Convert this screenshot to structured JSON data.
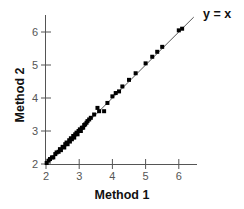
{
  "chart_data": {
    "type": "scatter",
    "title": "",
    "xlabel": "Method 1",
    "ylabel": "Method 2",
    "xlim": [
      2,
      6.5
    ],
    "ylim": [
      2,
      6.5
    ],
    "xticks": [
      "2",
      "3",
      "4",
      "5",
      "6"
    ],
    "yticks": [
      "2",
      "3",
      "4",
      "5",
      "6"
    ],
    "grid": false,
    "legend": null,
    "annotations": [
      {
        "text": "y = x",
        "position": "top-right, at end of identity line"
      }
    ],
    "reference_line": {
      "label": "y = x",
      "from": [
        2,
        2
      ],
      "to": [
        6.3,
        6.3
      ]
    },
    "series": [
      {
        "name": "Measurements",
        "marker": "square",
        "color": "#000000",
        "points": [
          [
            2.02,
            2.03
          ],
          [
            2.08,
            2.1
          ],
          [
            2.12,
            2.15
          ],
          [
            2.18,
            2.2
          ],
          [
            2.22,
            2.2
          ],
          [
            2.28,
            2.3
          ],
          [
            2.32,
            2.35
          ],
          [
            2.38,
            2.37
          ],
          [
            2.42,
            2.45
          ],
          [
            2.45,
            2.42
          ],
          [
            2.5,
            2.52
          ],
          [
            2.55,
            2.5
          ],
          [
            2.58,
            2.6
          ],
          [
            2.62,
            2.65
          ],
          [
            2.65,
            2.6
          ],
          [
            2.7,
            2.72
          ],
          [
            2.72,
            2.68
          ],
          [
            2.75,
            2.78
          ],
          [
            2.78,
            2.75
          ],
          [
            2.82,
            2.85
          ],
          [
            2.85,
            2.8
          ],
          [
            2.88,
            2.9
          ],
          [
            2.92,
            2.95
          ],
          [
            2.95,
            2.9
          ],
          [
            2.98,
            3.0
          ],
          [
            3.02,
            3.05
          ],
          [
            3.05,
            3.0
          ],
          [
            3.08,
            3.1
          ],
          [
            3.12,
            3.1
          ],
          [
            3.15,
            3.18
          ],
          [
            3.18,
            3.2
          ],
          [
            3.22,
            3.25
          ],
          [
            3.25,
            3.3
          ],
          [
            3.3,
            3.35
          ],
          [
            3.35,
            3.4
          ],
          [
            3.45,
            3.5
          ],
          [
            3.55,
            3.7
          ],
          [
            3.6,
            3.6
          ],
          [
            3.75,
            3.6
          ],
          [
            3.85,
            3.85
          ],
          [
            4.0,
            4.05
          ],
          [
            4.1,
            4.15
          ],
          [
            4.2,
            4.2
          ],
          [
            4.3,
            4.35
          ],
          [
            4.5,
            4.55
          ],
          [
            4.7,
            4.75
          ],
          [
            5.0,
            5.05
          ],
          [
            5.2,
            5.25
          ],
          [
            5.35,
            5.4
          ],
          [
            5.5,
            5.55
          ],
          [
            6.0,
            6.05
          ],
          [
            6.1,
            6.1
          ]
        ]
      }
    ]
  }
}
